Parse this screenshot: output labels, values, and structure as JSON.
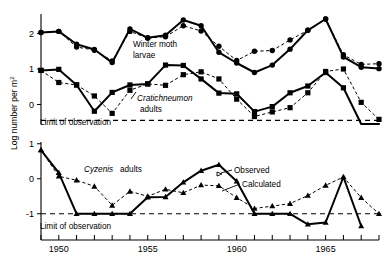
{
  "figure": {
    "ylabel": "Log number per m",
    "ylabel_sup": "2",
    "limit_label_top": "Limit of observation",
    "limit_label_bottom": "Limit of observation"
  },
  "annotations": {
    "winter_moth": "Winter moth",
    "winter_moth_2": "larvae",
    "cratichneumon": "Cratichneumon",
    "cratichneumon_2": "adults",
    "cyzenis_italic": "Cyzenis",
    "cyzenis_rest": "adults",
    "observed": "Observed",
    "calculated": "Calculated"
  },
  "axes": {
    "x": {
      "min": 1949,
      "max": 1968,
      "tick_years": [
        1949,
        1950,
        1951,
        1952,
        1953,
        1954,
        1955,
        1956,
        1957,
        1958,
        1959,
        1960,
        1961,
        1962,
        1963,
        1964,
        1965,
        1966,
        1967,
        1968
      ],
      "labeled_years": [
        1950,
        1955,
        1960,
        1965
      ],
      "labels": [
        "1950",
        "1955",
        "1960",
        "1965"
      ]
    },
    "y_top": {
      "min": -0.55,
      "max": 2.55,
      "ticks": [
        0,
        1,
        2
      ],
      "labels": [
        "0",
        "1",
        "2"
      ],
      "limit_of_observation": -0.45
    },
    "y_bottom": {
      "min": -1.35,
      "max": 1.05,
      "ticks": [
        -1,
        0,
        1
      ],
      "labels": [
        "-1",
        "0",
        "1"
      ],
      "limit_of_observation": -1.0
    }
  },
  "chart_data": {
    "type": "line",
    "title": "",
    "xlabel": "",
    "ylabel": "Log number per m2",
    "grid": false,
    "legend": [
      "Observed",
      "Calculated"
    ],
    "legend_position": "inline-annotation",
    "panels": [
      {
        "name": "top-panel",
        "ylim": [
          -0.55,
          2.55
        ],
        "yticks": [
          0,
          1,
          2
        ],
        "series": [
          {
            "name": "Winter moth larvae (observed)",
            "marker": "circle",
            "line": "solid",
            "x": [
              1949,
              1950,
              1951,
              1952,
              1953,
              1954,
              1955,
              1956,
              1957,
              1958,
              1959,
              1960,
              1961,
              1962,
              1963,
              1964,
              1965,
              1966,
              1967,
              1968
            ],
            "y": [
              2.03,
              2.06,
              1.7,
              1.55,
              1.18,
              2.13,
              1.88,
              1.95,
              2.38,
              2.22,
              1.47,
              1.17,
              0.9,
              1.11,
              1.56,
              2.09,
              2.41,
              1.34,
              1.05,
              1.01
            ]
          },
          {
            "name": "Winter moth larvae (calculated)",
            "marker": "circle",
            "line": "dashed",
            "x": [
              1949,
              1950,
              1951,
              1952,
              1953,
              1954,
              1955,
              1956,
              1957,
              1958,
              1959,
              1960,
              1961,
              1962,
              1963,
              1964,
              1965,
              1966,
              1967,
              1968
            ],
            "y": [
              2.03,
              2.06,
              1.62,
              1.53,
              1.23,
              2.06,
              1.87,
              1.91,
              2.22,
              2.07,
              1.64,
              1.24,
              1.5,
              1.52,
              1.82,
              2.09,
              2.41,
              1.4,
              1.13,
              1.15
            ]
          },
          {
            "name": "Cratichneumon adults (observed)",
            "marker": "square",
            "line": "solid",
            "x": [
              1949,
              1950,
              1951,
              1952,
              1953,
              1954,
              1955,
              1956,
              1957,
              1958,
              1959,
              1960,
              1961,
              1962,
              1963,
              1964,
              1965,
              1966,
              1967,
              1968
            ],
            "y": [
              0.96,
              0.99,
              0.55,
              -0.19,
              0.34,
              0.55,
              0.58,
              1.11,
              1.1,
              0.72,
              0.32,
              0.3,
              -0.2,
              -0.06,
              0.33,
              0.52,
              0.9,
              0.47,
              -1.0,
              -1.0
            ]
          },
          {
            "name": "Cratichneumon adults (calculated)",
            "marker": "square",
            "line": "dashed",
            "x": [
              1949,
              1950,
              1951,
              1952,
              1953,
              1954,
              1955,
              1956,
              1957,
              1958,
              1959,
              1960,
              1961,
              1962,
              1963,
              1964,
              1965,
              1966,
              1967,
              1968
            ],
            "y": [
              0.96,
              0.62,
              0.55,
              0.24,
              -0.25,
              0.4,
              0.58,
              0.54,
              0.84,
              0.92,
              0.72,
              0.15,
              -0.34,
              -0.21,
              -0.09,
              0.33,
              0.93,
              1.0,
              0.06,
              -0.42
            ]
          }
        ]
      },
      {
        "name": "bottom-panel",
        "ylim": [
          -1.35,
          1.05
        ],
        "yticks": [
          -1,
          0,
          1
        ],
        "series": [
          {
            "name": "Cyzenis adults (observed)",
            "marker": "triangle",
            "line": "solid",
            "x": [
              1949,
              1950,
              1951,
              1952,
              1953,
              1954,
              1955,
              1956,
              1957,
              1958,
              1959,
              1960,
              1961,
              1962,
              1963,
              1964,
              1965,
              1966,
              1967
            ],
            "y": [
              0.82,
              0.17,
              -1.0,
              -1.0,
              -1.0,
              -1.0,
              -0.53,
              -0.52,
              -0.1,
              0.23,
              0.4,
              -0.07,
              -1.0,
              -1.0,
              -1.0,
              -1.3,
              -1.25,
              0.05,
              -1.35
            ]
          },
          {
            "name": "Cyzenis adults (calculated)",
            "marker": "triangle",
            "line": "dashed",
            "x": [
              1949,
              1950,
              1951,
              1952,
              1953,
              1954,
              1955,
              1956,
              1957,
              1958,
              1959,
              1960,
              1961,
              1962,
              1963,
              1964,
              1965,
              1966,
              1967,
              1968
            ],
            "y": [
              0.82,
              0.07,
              -0.04,
              -0.22,
              -0.76,
              -0.36,
              -0.5,
              -0.3,
              -0.4,
              -0.18,
              -0.2,
              -0.54,
              -0.85,
              -0.78,
              -0.71,
              -0.48,
              -0.19,
              0.05,
              -0.54,
              -1.0
            ]
          }
        ]
      }
    ]
  }
}
